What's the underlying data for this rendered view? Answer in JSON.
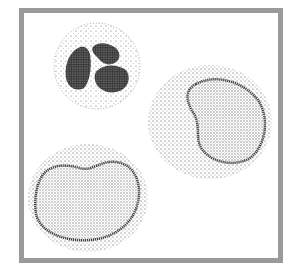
{
  "figure": {
    "frame_color": "#9a9a9a",
    "ink_color": "#1a1a1a",
    "cells": [
      {
        "name": "neutrophil",
        "description": "Small round cell with multilobed (segmented) dark nucleus",
        "cx": 97,
        "cy": 66,
        "r": 44
      },
      {
        "name": "monocyte-right",
        "description": "Large cell with kidney-shaped stippled nucleus",
        "cx": 210,
        "cy": 122,
        "rx": 60,
        "ry": 56
      },
      {
        "name": "monocyte-left",
        "description": "Large cell with indented oval stippled nucleus",
        "cx": 88,
        "cy": 198,
        "rx": 60,
        "ry": 54
      }
    ]
  }
}
